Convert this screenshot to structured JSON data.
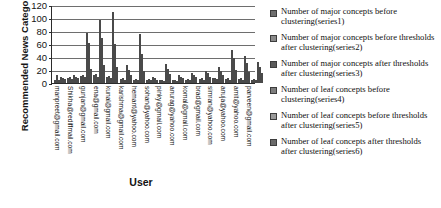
{
  "chart_data": {
    "type": "bar",
    "title": "",
    "xlabel": "User",
    "ylabel": "Recommended News Categories",
    "ylim": [
      0,
      120
    ],
    "yticks": [
      120,
      100,
      80,
      60,
      40,
      20,
      0
    ],
    "grid": true,
    "legend_position": "right",
    "categories": [
      "manpreet@gmail.com",
      "Shikha@rediffmail.com",
      "gunjan@gmail.com",
      "ena@gmail.com",
      "kunal@gmail.com",
      "karishma@gmail.com",
      "hemant@yahoo.com",
      "sohan@yahoo.com",
      "pinky@gmail.com",
      "anurag@yahoo.com",
      "komal@gmail.com",
      "brad@gmail.com",
      "simran@yahoo.com",
      "anuja@yahoo.com",
      "amit@yahoo.com",
      "parveen@gmail.com"
    ],
    "series": [
      {
        "name": "Number of major concepts before clustering(series1)",
        "color": "#6e6e6e",
        "values": [
          5,
          8,
          11,
          13,
          10,
          6,
          5,
          5,
          4,
          4,
          5,
          6,
          7,
          6,
          6,
          5
        ]
      },
      {
        "name": "Number of major concepts before thresholds after clustering(series2)",
        "color": "#8a8a8a",
        "values": [
          13,
          9,
          12,
          14,
          11,
          7,
          6,
          6,
          5,
          5,
          6,
          7,
          8,
          7,
          7,
          6
        ]
      },
      {
        "name": "Number of major concepts after thresholds after clustering(series3)",
        "color": "#5a5a5a",
        "values": [
          4,
          6,
          9,
          10,
          8,
          5,
          4,
          4,
          3,
          3,
          4,
          5,
          6,
          5,
          5,
          4
        ]
      },
      {
        "name": "Number of leaf concepts before clustering(series4)",
        "color": "#7d7d7d",
        "values": [
          9,
          13,
          77,
          97,
          110,
          27,
          75,
          9,
          29,
          12,
          16,
          18,
          24,
          51,
          41,
          33
        ]
      },
      {
        "name": "Number of leaf concepts before thresholds after clustering(series5)",
        "color": "#9a9a9a",
        "values": [
          7,
          10,
          61,
          69,
          60,
          20,
          44,
          7,
          21,
          10,
          13,
          15,
          19,
          38,
          31,
          25
        ]
      },
      {
        "name": "Number of leaf concepts after thresholds after clustering(series6)",
        "color": "#6a6a6a",
        "values": [
          6,
          8,
          22,
          27,
          24,
          12,
          18,
          5,
          14,
          7,
          9,
          10,
          12,
          20,
          17,
          15
        ]
      }
    ]
  },
  "legend": {
    "items": [
      {
        "label": "Number of major concepts before clustering(series1)"
      },
      {
        "label": "Number of major concepts before thresholds after clustering(series2)"
      },
      {
        "label": "Number of major concepts after thresholds after clustering(series3)"
      },
      {
        "label": "Number of leaf concepts before clustering(series4)"
      },
      {
        "label": "Number of leaf concepts before thresholds after clustering(series5)"
      },
      {
        "label": "Number of leaf concepts after thresholds after clustering(series6)"
      }
    ]
  }
}
